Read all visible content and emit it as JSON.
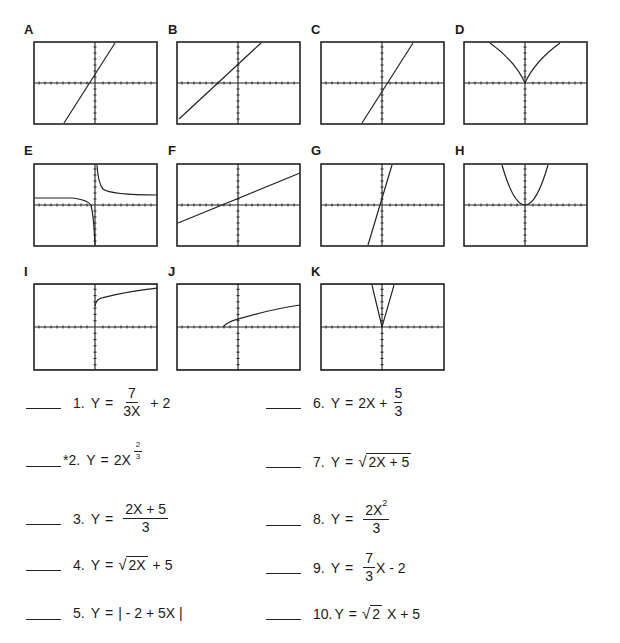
{
  "graphs": [
    {
      "label": "A",
      "type": "line",
      "description": "steep increasing line, y-intercept slightly above origin"
    },
    {
      "label": "B",
      "type": "line",
      "description": "increasing line, moderate slope, positive y-intercept"
    },
    {
      "label": "C",
      "type": "line",
      "description": "steep increasing line, negative y-intercept"
    },
    {
      "label": "D",
      "type": "cusp",
      "description": "cusp at origin opening upward"
    },
    {
      "label": "E",
      "type": "hyperbola",
      "description": "vertical asymptote at x=0, horizontal asymptote above x-axis"
    },
    {
      "label": "F",
      "type": "line",
      "description": "gentle increasing line, positive y-intercept"
    },
    {
      "label": "G",
      "type": "line",
      "description": "very steep increasing line through near origin"
    },
    {
      "label": "H",
      "type": "parabola",
      "description": "upward parabola vertex at origin"
    },
    {
      "label": "I",
      "type": "sqrt",
      "description": "square root curve starting at (0, positive)"
    },
    {
      "label": "J",
      "type": "sqrt",
      "description": "square root curve starting left of origin on x-axis"
    },
    {
      "label": "K",
      "type": "absolute",
      "description": "narrow V-shape vertex near origin"
    }
  ],
  "equations": [
    {
      "num": "1.",
      "lhs": "Y",
      "eq": "=",
      "parts": {
        "numerator": "7",
        "denominator": "3X",
        "tail": "+ 2"
      }
    },
    {
      "num": "*2.",
      "lhs": "Y",
      "eq": "=",
      "parts": {
        "base": "2X",
        "exp_num": "2",
        "exp_den": "3"
      }
    },
    {
      "num": "3.",
      "lhs": "Y",
      "eq": "=",
      "parts": {
        "numerator": "2X + 5",
        "denominator": "3"
      }
    },
    {
      "num": "4.",
      "lhs": "Y",
      "eq": "=",
      "parts": {
        "radicand": "2X",
        "tail": "+ 5"
      }
    },
    {
      "num": "5.",
      "lhs": "Y",
      "eq": "=",
      "parts": {
        "abs": "| - 2 + 5X |"
      }
    },
    {
      "num": "6.",
      "lhs": "Y",
      "eq": "=",
      "parts": {
        "head": "2X +",
        "numerator": "5",
        "denominator": "3"
      }
    },
    {
      "num": "7.",
      "lhs": "Y",
      "eq": "=",
      "parts": {
        "radicand": "2X + 5"
      }
    },
    {
      "num": "8.",
      "lhs": "Y",
      "eq": "=",
      "parts": {
        "numerator": "2X",
        "num_exp": "2",
        "denominator": "3"
      }
    },
    {
      "num": "9.",
      "lhs": "Y",
      "eq": "=",
      "parts": {
        "numerator": "7",
        "denominator": "3",
        "tail": "X - 2"
      }
    },
    {
      "num": "10.",
      "lhs": "Y",
      "eq": "=",
      "parts": {
        "radicand": "2",
        "tail": "X + 5"
      }
    }
  ]
}
